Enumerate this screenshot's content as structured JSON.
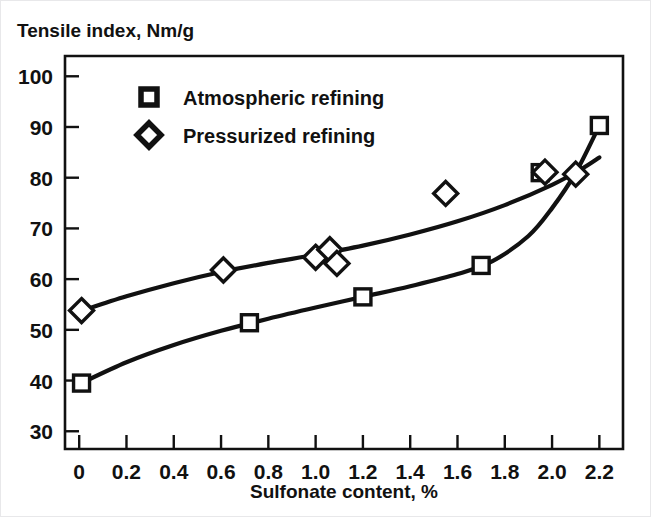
{
  "chart_data": {
    "type": "line",
    "title": "",
    "ylabel": "Tensile index, Nm/g",
    "xlabel": "Sulfonate content, %",
    "xlim": [
      -0.06,
      2.3
    ],
    "ylim": [
      26.5,
      104
    ],
    "grid": false,
    "legend_position": "top-left-inside",
    "xticks": [
      0,
      0.2,
      0.4,
      0.6,
      0.8,
      1.0,
      1.2,
      1.4,
      1.6,
      1.8,
      2.0,
      2.2
    ],
    "xtick_labels": [
      "0",
      "0.2",
      "0.4",
      "0.6",
      "0.8",
      "1.0",
      "1.2",
      "1.4",
      "1.6",
      "1.8",
      "2.0",
      "2.2"
    ],
    "yticks": [
      30,
      40,
      50,
      60,
      70,
      80,
      90,
      100
    ],
    "ytick_labels": [
      "30",
      "40",
      "50",
      "60",
      "70",
      "80",
      "90",
      "100"
    ],
    "series": [
      {
        "name": "Atmospheric refining",
        "marker": "square",
        "marker_fill": "#ffffff",
        "marker_stroke": "#111111",
        "line_color": "#111111",
        "points": [
          {
            "x": 0.01,
            "y": 39.5
          },
          {
            "x": 0.72,
            "y": 51.4
          },
          {
            "x": 1.2,
            "y": 56.5
          },
          {
            "x": 1.7,
            "y": 62.7
          },
          {
            "x": 1.95,
            "y": 81.0
          },
          {
            "x": 2.2,
            "y": 90.3
          }
        ],
        "curve": [
          {
            "x": 0.0,
            "y": 39.3
          },
          {
            "x": 0.2,
            "y": 43.6
          },
          {
            "x": 0.4,
            "y": 47.0
          },
          {
            "x": 0.6,
            "y": 49.8
          },
          {
            "x": 0.8,
            "y": 52.2
          },
          {
            "x": 1.0,
            "y": 54.4
          },
          {
            "x": 1.2,
            "y": 56.5
          },
          {
            "x": 1.4,
            "y": 58.6
          },
          {
            "x": 1.6,
            "y": 61.0
          },
          {
            "x": 1.75,
            "y": 63.6
          },
          {
            "x": 1.9,
            "y": 68.5
          },
          {
            "x": 2.0,
            "y": 74.0
          },
          {
            "x": 2.1,
            "y": 81.0
          },
          {
            "x": 2.2,
            "y": 90.3
          }
        ]
      },
      {
        "name": "Pressurized refining",
        "marker": "diamond",
        "marker_fill": "#ffffff",
        "marker_stroke": "#111111",
        "line_color": "#111111",
        "points": [
          {
            "x": 0.01,
            "y": 53.8
          },
          {
            "x": 0.61,
            "y": 61.8
          },
          {
            "x": 1.0,
            "y": 64.3
          },
          {
            "x": 1.06,
            "y": 65.8
          },
          {
            "x": 1.09,
            "y": 63.1
          },
          {
            "x": 1.55,
            "y": 76.9
          },
          {
            "x": 1.97,
            "y": 81.1
          },
          {
            "x": 2.1,
            "y": 80.7
          }
        ],
        "curve": [
          {
            "x": 0.0,
            "y": 53.6
          },
          {
            "x": 0.2,
            "y": 56.6
          },
          {
            "x": 0.4,
            "y": 59.2
          },
          {
            "x": 0.6,
            "y": 61.4
          },
          {
            "x": 0.8,
            "y": 63.2
          },
          {
            "x": 1.0,
            "y": 64.8
          },
          {
            "x": 1.2,
            "y": 66.6
          },
          {
            "x": 1.4,
            "y": 68.8
          },
          {
            "x": 1.6,
            "y": 71.4
          },
          {
            "x": 1.8,
            "y": 74.6
          },
          {
            "x": 2.0,
            "y": 78.6
          },
          {
            "x": 2.12,
            "y": 81.6
          },
          {
            "x": 2.2,
            "y": 84.0
          }
        ]
      }
    ]
  },
  "legend": {
    "entries": [
      {
        "label": "Atmospheric refining",
        "marker": "square"
      },
      {
        "label": "Pressurized refining",
        "marker": "diamond"
      }
    ]
  }
}
